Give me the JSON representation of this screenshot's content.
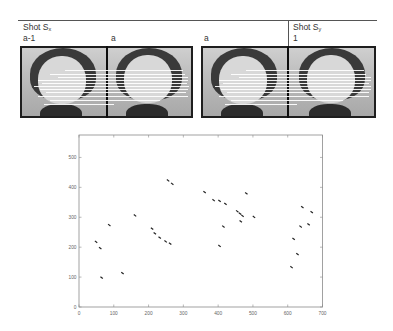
{
  "header": {
    "shot_x_label": "Shot S",
    "shot_x_sub": "x",
    "shot_y_label": "Shot S",
    "shot_y_sub": "y",
    "frame_labels": [
      "a-1",
      "a",
      "a",
      "1"
    ]
  },
  "chart_data": {
    "type": "scatter",
    "title": "",
    "xlabel": "",
    "ylabel": "",
    "xlim": [
      0,
      700
    ],
    "ylim": [
      0,
      575
    ],
    "xticks": [
      0,
      100,
      200,
      300,
      400,
      500,
      600,
      700
    ],
    "yticks": [
      0,
      100,
      200,
      300,
      400,
      500
    ],
    "grid": false,
    "legend": null,
    "points": [
      [
        49,
        218
      ],
      [
        61,
        197
      ],
      [
        65,
        98
      ],
      [
        87,
        274
      ],
      [
        125,
        113
      ],
      [
        161,
        306
      ],
      [
        210,
        262
      ],
      [
        218,
        246
      ],
      [
        232,
        232
      ],
      [
        249,
        219
      ],
      [
        262,
        212
      ],
      [
        256,
        423
      ],
      [
        268,
        412
      ],
      [
        361,
        384
      ],
      [
        387,
        357
      ],
      [
        404,
        355
      ],
      [
        421,
        345
      ],
      [
        455,
        320
      ],
      [
        463,
        312
      ],
      [
        470,
        305
      ],
      [
        481,
        380
      ],
      [
        415,
        269
      ],
      [
        465,
        286
      ],
      [
        503,
        301
      ],
      [
        404,
        204
      ],
      [
        642,
        334
      ],
      [
        669,
        317
      ],
      [
        660,
        276
      ],
      [
        637,
        269
      ],
      [
        617,
        228
      ],
      [
        628,
        177
      ],
      [
        611,
        133
      ]
    ]
  }
}
